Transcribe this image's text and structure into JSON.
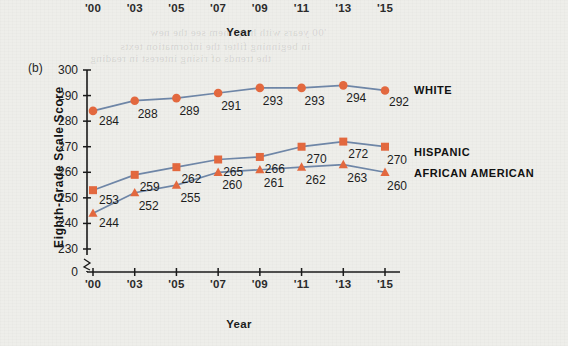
{
  "figure": {
    "panel_label": "(b)",
    "background_color": "#eeeeea",
    "marker_color": "#e4693f",
    "line_color": "#6f87a8",
    "axis_color": "#1a1a1a"
  },
  "top_partial_chart": {
    "note": "bottom edge of panel (a) cropped at top of image",
    "tick_labels": [
      "'00",
      "'03",
      "'05",
      "'07",
      "'09",
      "'11",
      "'13",
      "'15"
    ],
    "axis_title": "Year"
  },
  "bleed_through": [
    {
      "text": "'00 years with help them see the new",
      "x": 150,
      "y": 26
    },
    {
      "text": "in beginning filter the information texts",
      "x": 120,
      "y": 40
    },
    {
      "text": "the trends of rising interest in reading",
      "x": 90,
      "y": 52
    }
  ],
  "chart_data": {
    "type": "line",
    "title": "",
    "subtitle": "",
    "panel": "(b)",
    "xlabel": "Year",
    "ylabel": "Eighth-Grade  Scale Score",
    "categories": [
      "'00",
      "'03",
      "'05",
      "'07",
      "'09",
      "'11",
      "'13",
      "'15"
    ],
    "x": [
      2000,
      2003,
      2005,
      2007,
      2009,
      2011,
      2013,
      2015
    ],
    "ylim": [
      230,
      300
    ],
    "yticks": [
      300,
      290,
      280,
      270,
      260,
      250,
      240,
      230
    ],
    "y_zero_tick": "0",
    "y_axis_break": true,
    "grid": false,
    "legend_position": "right",
    "series": [
      {
        "name": "WHITE",
        "marker": "circle",
        "color": "#e4693f",
        "values": [
          284,
          288,
          289,
          291,
          293,
          293,
          294,
          292
        ]
      },
      {
        "name": "HISPANIC",
        "marker": "square",
        "color": "#e4693f",
        "values": [
          253,
          259,
          262,
          265,
          266,
          270,
          272,
          270
        ]
      },
      {
        "name": "AFRICAN AMERICAN",
        "marker": "triangle",
        "color": "#e4693f",
        "values": [
          244,
          252,
          255,
          260,
          261,
          262,
          263,
          260
        ]
      }
    ],
    "legend_entries": [
      "WHITE",
      "HISPANIC",
      "AFRICAN AMERICAN"
    ]
  }
}
